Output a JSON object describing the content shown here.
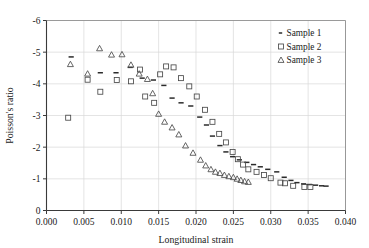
{
  "chart_data": {
    "type": "scatter",
    "title": "",
    "xlabel": "Longitudinal strain",
    "ylabel": "Poisson's ratio",
    "xlim": [
      0.0,
      0.04
    ],
    "ylim": [
      -6,
      0
    ],
    "y_axis_inverted": true,
    "xticks": [
      "0.000",
      "0.005",
      "0.010",
      "0.015",
      "0.020",
      "0.025",
      "0.030",
      "0.035",
      "0.040"
    ],
    "xtick_values": [
      0.0,
      0.005,
      0.01,
      0.015,
      0.02,
      0.025,
      0.03,
      0.035,
      0.04
    ],
    "yticks": [
      "-6",
      "-5",
      "-4",
      "-3",
      "-2",
      "-1",
      "0"
    ],
    "ytick_values": [
      -6,
      -5,
      -4,
      -3,
      -2,
      -1,
      0
    ],
    "grid": true,
    "legend_position": "top-right",
    "series": [
      {
        "name": "Sample 1",
        "marker": "dash",
        "color": "#2b2b2b",
        "points": [
          [
            0.0033,
            -4.85
          ],
          [
            0.0072,
            -4.35
          ],
          [
            0.0093,
            -4.35
          ],
          [
            0.0112,
            -4.52
          ],
          [
            0.0128,
            -4.18
          ],
          [
            0.0143,
            -4.12
          ],
          [
            0.0157,
            -3.95
          ],
          [
            0.0168,
            -3.55
          ],
          [
            0.018,
            -3.4
          ],
          [
            0.0193,
            -3.3
          ],
          [
            0.0205,
            -2.95
          ],
          [
            0.0214,
            -2.7
          ],
          [
            0.0222,
            -2.35
          ],
          [
            0.0232,
            -2.05
          ],
          [
            0.024,
            -1.85
          ],
          [
            0.0249,
            -1.7
          ],
          [
            0.0258,
            -1.6
          ],
          [
            0.0268,
            -1.52
          ],
          [
            0.0277,
            -1.45
          ],
          [
            0.0286,
            -1.38
          ],
          [
            0.0296,
            -1.3
          ],
          [
            0.0308,
            -1.22
          ],
          [
            0.0318,
            -1.05
          ],
          [
            0.0327,
            -0.95
          ],
          [
            0.0335,
            -0.88
          ],
          [
            0.0344,
            -0.84
          ],
          [
            0.0352,
            -0.82
          ],
          [
            0.036,
            -0.8
          ],
          [
            0.0368,
            -0.78
          ],
          [
            0.0374,
            -0.77
          ]
        ]
      },
      {
        "name": "Sample 2",
        "marker": "square",
        "color": "#4a4a4a",
        "points": [
          [
            0.0029,
            -2.93
          ],
          [
            0.0055,
            -4.13
          ],
          [
            0.0072,
            -3.75
          ],
          [
            0.0094,
            -4.12
          ],
          [
            0.0113,
            -4.08
          ],
          [
            0.0125,
            -4.45
          ],
          [
            0.0132,
            -3.6
          ],
          [
            0.0144,
            -3.4
          ],
          [
            0.0152,
            -4.3
          ],
          [
            0.016,
            -4.55
          ],
          [
            0.017,
            -4.52
          ],
          [
            0.018,
            -4.18
          ],
          [
            0.0191,
            -3.92
          ],
          [
            0.0201,
            -3.6
          ],
          [
            0.0212,
            -3.18
          ],
          [
            0.0222,
            -2.8
          ],
          [
            0.0231,
            -2.42
          ],
          [
            0.024,
            -2.15
          ],
          [
            0.0249,
            -1.85
          ],
          [
            0.0256,
            -1.62
          ],
          [
            0.0263,
            -1.45
          ],
          [
            0.027,
            -1.3
          ],
          [
            0.0281,
            -1.22
          ],
          [
            0.0291,
            -1.12
          ],
          [
            0.03,
            -1.02
          ],
          [
            0.0313,
            -0.88
          ],
          [
            0.0319,
            -0.86
          ],
          [
            0.033,
            -0.78
          ],
          [
            0.0345,
            -0.74
          ],
          [
            0.0353,
            -0.74
          ]
        ]
      },
      {
        "name": "Sample 3",
        "marker": "triangle",
        "color": "#4a4a4a",
        "points": [
          [
            0.0032,
            -4.62
          ],
          [
            0.0055,
            -4.32
          ],
          [
            0.0071,
            -5.12
          ],
          [
            0.0087,
            -4.92
          ],
          [
            0.0101,
            -4.93
          ],
          [
            0.0113,
            -4.6
          ],
          [
            0.0124,
            -4.32
          ],
          [
            0.0135,
            -4.15
          ],
          [
            0.0142,
            -3.7
          ],
          [
            0.015,
            -3.05
          ],
          [
            0.0158,
            -2.8
          ],
          [
            0.0168,
            -2.62
          ],
          [
            0.0177,
            -2.4
          ],
          [
            0.0186,
            -2.05
          ],
          [
            0.0196,
            -1.82
          ],
          [
            0.0206,
            -1.6
          ],
          [
            0.0213,
            -1.42
          ],
          [
            0.022,
            -1.3
          ],
          [
            0.0226,
            -1.22
          ],
          [
            0.0232,
            -1.18
          ],
          [
            0.0238,
            -1.12
          ],
          [
            0.0244,
            -1.08
          ],
          [
            0.025,
            -1.05
          ],
          [
            0.0255,
            -1.0
          ],
          [
            0.026,
            -0.96
          ],
          [
            0.0265,
            -0.92
          ],
          [
            0.027,
            -0.9
          ]
        ]
      }
    ]
  },
  "legend": {
    "items": [
      {
        "label": "Sample 1"
      },
      {
        "label": "Sample 2"
      },
      {
        "label": "Sample 3"
      }
    ]
  }
}
